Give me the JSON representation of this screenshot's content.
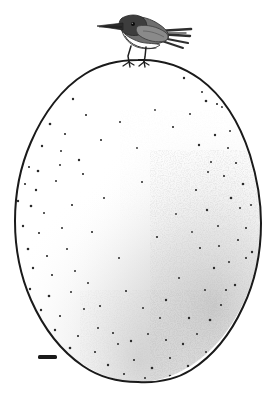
{
  "figure": {
    "kind": "scientific-line-illustration",
    "medium": "pen-and-ink stipple drawing",
    "background_color": "#ffffff",
    "ink_color": "#1a1a1a",
    "width_px": 280,
    "height_px": 398
  },
  "subjects": {
    "bird": {
      "label": "bird",
      "pose": "perched, facing left",
      "bounding_box": {
        "x": 96,
        "y": 13,
        "width": 95,
        "height": 62
      },
      "parts": {
        "beak": {
          "label": "beak",
          "color": "#2b2b2b",
          "direction": "left",
          "tip_x": 97,
          "tip_y": 27
        },
        "eye": {
          "label": "eye",
          "color": "#111111",
          "cx": 133,
          "cy": 24,
          "r": 2.0
        },
        "crown": {
          "label": "crown",
          "color": "#3d3d3d"
        },
        "throat": {
          "label": "throat",
          "color": "#fdfdfd"
        },
        "breast": {
          "label": "breast",
          "color": "#fbfbfb"
        },
        "wing": {
          "label": "wing",
          "color": "#8a8a8a"
        },
        "back": {
          "label": "back",
          "color": "#6e6e6e"
        },
        "tail": {
          "label": "tail",
          "color": "#3a3a3a",
          "feather_count": 4,
          "tip_x": 191
        },
        "legs": {
          "label": "legs",
          "color": "#1f1f1f",
          "count": 2
        },
        "feet": {
          "label": "feet",
          "color": "#1f1f1f",
          "gripping": "egg apex"
        }
      }
    },
    "egg": {
      "label": "egg",
      "shape": "ovoid",
      "outline_color": "#1a1a1a",
      "outline_width_px": 2.0,
      "fill_color": "#ffffff",
      "center_x": 138,
      "center_y": 221,
      "radius_x": 123,
      "radius_y": 161,
      "top_y": 60,
      "bottom_y": 382,
      "left_x": 15,
      "right_x": 261,
      "shading": {
        "label": "stipple shading",
        "color": "#b9b9b9",
        "concentration": "lower-right quadrant",
        "description": "dense gray mottled stippling along the right flank and bottom, fading to blank white toward the upper-left"
      },
      "speckles": {
        "label": "dark speckles",
        "color": "#2a2a2a",
        "count": 118,
        "size_range_px": [
          0.9,
          2.1
        ],
        "distribution": "scattered across the whole shell, sparsest at the center, densest near the right and lower margins"
      }
    },
    "scale_bar": {
      "label": "scale bar",
      "color": "#1a1a1a",
      "x": 38,
      "y": 355,
      "width": 19,
      "height": 4
    }
  },
  "annotations": {
    "caption": "A small bird perched on the apex of a very large speckled egg, with a scale bar at lower left."
  }
}
